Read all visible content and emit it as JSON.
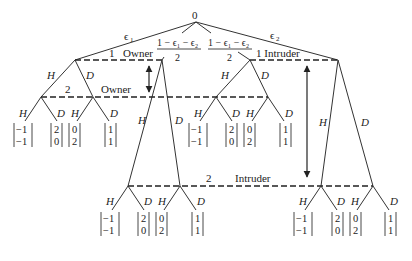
{
  "diagram": {
    "type": "extensive-form game tree",
    "root": {
      "label": "0",
      "x": 196,
      "y": 22
    },
    "chance_branches": [
      {
        "label_top": "ϵ",
        "sub": "1",
        "kind": "single",
        "to": "A"
      },
      {
        "label_num": "1 − ϵ₁ − ϵ₂",
        "label_den": "2",
        "kind": "fraction",
        "to": "B"
      },
      {
        "label_num": "1 − ϵ₁ − ϵ₂",
        "label_den": "2",
        "kind": "fraction",
        "to": "C"
      },
      {
        "label_top": "ϵ",
        "sub": "2",
        "kind": "single",
        "to": "D"
      }
    ],
    "nodes": {
      "A": {
        "x": 75,
        "y": 60
      },
      "B": {
        "x": 162,
        "y": 60
      },
      "C": {
        "x": 250,
        "y": 60
      },
      "D": {
        "x": 338,
        "y": 60
      },
      "A_H": {
        "x": 41,
        "y": 97
      },
      "A_D": {
        "x": 93,
        "y": 97
      },
      "C_H": {
        "x": 216,
        "y": 97
      },
      "C_D": {
        "x": 268,
        "y": 97
      },
      "B_H": {
        "x": 128,
        "y": 186
      },
      "B_D": {
        "x": 180,
        "y": 186
      },
      "D_H": {
        "x": 321,
        "y": 186
      },
      "D_D": {
        "x": 373,
        "y": 186
      }
    },
    "information_sets": [
      {
        "id": "owner1",
        "player_num": "1",
        "player": "Owner",
        "from": "A",
        "to": "B"
      },
      {
        "id": "intruder1",
        "player_num": "1",
        "player": "Intruder",
        "from": "C",
        "to": "D"
      },
      {
        "id": "owner2",
        "player_num": "2",
        "player": "Owner",
        "from": "A_H",
        "to": "C_D"
      },
      {
        "id": "intruder2",
        "player_num": "2",
        "player": "Intruder",
        "from": "B_H",
        "to": "D_D"
      }
    ],
    "actions": {
      "hawk": "H",
      "dove": "D"
    },
    "payoff_groups": [
      {
        "parent": "A_H",
        "payoffs": [
          [
            "−1",
            "−1"
          ],
          [
            "2",
            "0"
          ]
        ]
      },
      {
        "parent": "A_D",
        "payoffs": [
          [
            "0",
            "2"
          ],
          [
            "1",
            "1"
          ]
        ]
      },
      {
        "parent": "C_H",
        "payoffs": [
          [
            "−1",
            "−1"
          ],
          [
            "2",
            "0"
          ]
        ]
      },
      {
        "parent": "C_D",
        "payoffs": [
          [
            "0",
            "2"
          ],
          [
            "1",
            "1"
          ]
        ]
      },
      {
        "parent": "B_H",
        "payoffs": [
          [
            "−1",
            "−1"
          ],
          [
            "2",
            "0"
          ]
        ]
      },
      {
        "parent": "B_D",
        "payoffs": [
          [
            "0",
            "2"
          ],
          [
            "1",
            "1"
          ]
        ]
      },
      {
        "parent": "D_H",
        "payoffs": [
          [
            "−1",
            "−1"
          ],
          [
            "2",
            "0"
          ]
        ]
      },
      {
        "parent": "D_D",
        "payoffs": [
          [
            "0",
            "2"
          ],
          [
            "1",
            "1"
          ]
        ]
      }
    ],
    "arrows": [
      {
        "name": "owner-double-arrow",
        "x": 149,
        "y1": 65,
        "y2": 93,
        "style": "double"
      },
      {
        "name": "intruder-double-arrow",
        "x": 307,
        "y1": 65,
        "y2": 178,
        "style": "double"
      }
    ],
    "colors": {
      "line": "#333333",
      "text": "#222222",
      "background": "#ffffff"
    }
  },
  "labels": {
    "root": "0",
    "eps": "ϵ",
    "eps1_sub": "1",
    "eps2_sub": "2",
    "frac_num": "1 − ϵ₁ − ϵ₂",
    "frac_den": "2",
    "owner1_num": "1",
    "owner1_name": "Owner",
    "intruder1": "1 Intruder",
    "owner2_num": "2",
    "owner2_name": "Owner",
    "intruder2_num": "2",
    "intruder2_name": "Intruder",
    "H": "H",
    "D": "D",
    "p_m1": "−1",
    "p_2": "2",
    "p_0": "0",
    "p_1": "1"
  }
}
